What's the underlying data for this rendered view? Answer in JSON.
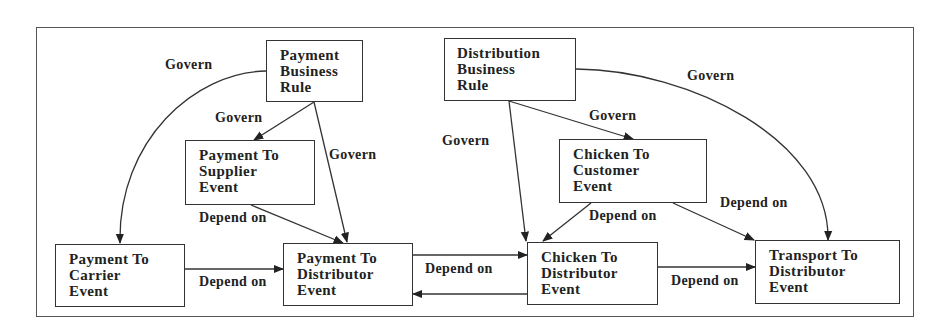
{
  "diagram": {
    "nodes": [
      {
        "id": "payment-business-rule",
        "lines": [
          "Payment",
          "Business",
          "Rule"
        ]
      },
      {
        "id": "distribution-business-rule",
        "lines": [
          "Distribution",
          "Business",
          "Rule"
        ]
      },
      {
        "id": "payment-to-supplier-event",
        "lines": [
          "Payment To",
          "Supplier",
          "Event"
        ]
      },
      {
        "id": "chicken-to-customer-event",
        "lines": [
          "Chicken To",
          "Customer",
          "Event"
        ]
      },
      {
        "id": "payment-to-carrier-event",
        "lines": [
          "Payment To",
          "Carrier",
          "Event"
        ]
      },
      {
        "id": "payment-to-distributor-event",
        "lines": [
          "Payment To",
          "Distributor",
          "Event"
        ]
      },
      {
        "id": "chicken-to-distributor-event",
        "lines": [
          "Chicken To",
          "Distributor",
          "Event"
        ]
      },
      {
        "id": "transport-to-distributor-event",
        "lines": [
          "Transport To",
          "Distributor",
          "Event"
        ]
      }
    ],
    "edges": [
      {
        "from": "payment-business-rule",
        "to": "payment-to-carrier-event",
        "label": "Govern"
      },
      {
        "from": "payment-business-rule",
        "to": "payment-to-supplier-event",
        "label": "Govern"
      },
      {
        "from": "payment-business-rule",
        "to": "payment-to-distributor-event",
        "label": "Govern"
      },
      {
        "from": "distribution-business-rule",
        "to": "chicken-to-distributor-event",
        "label": "Govern"
      },
      {
        "from": "distribution-business-rule",
        "to": "chicken-to-customer-event",
        "label": "Govern"
      },
      {
        "from": "distribution-business-rule",
        "to": "transport-to-distributor-event",
        "label": "Govern"
      },
      {
        "from": "payment-to-supplier-event",
        "to": "payment-to-distributor-event",
        "label": "Depend on"
      },
      {
        "from": "payment-to-carrier-event",
        "to": "payment-to-distributor-event",
        "label": "Depend on"
      },
      {
        "from": "payment-to-distributor-event",
        "to": "chicken-to-distributor-event",
        "label": "Depend on"
      },
      {
        "from": "chicken-to-distributor-event",
        "to": "payment-to-distributor-event",
        "label": ""
      },
      {
        "from": "chicken-to-customer-event",
        "to": "chicken-to-distributor-event",
        "label": "Depend on"
      },
      {
        "from": "chicken-to-customer-event",
        "to": "transport-to-distributor-event",
        "label": "Depend on"
      },
      {
        "from": "chicken-to-distributor-event",
        "to": "transport-to-distributor-event",
        "label": "Depend on"
      }
    ]
  }
}
